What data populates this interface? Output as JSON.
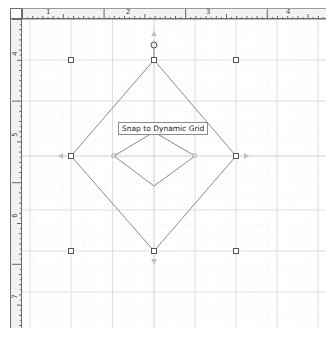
{
  "rulers": {
    "horizontal_labels": [
      "1",
      "2",
      "3",
      "4"
    ],
    "vertical_labels": [
      "4",
      "5",
      "6",
      "7"
    ]
  },
  "canvas": {
    "tooltip": "Snap to Dynamic Grid",
    "shape": {
      "type": "diamond",
      "outer": {
        "top": [
          154,
          60
        ],
        "left": [
          71,
          156
        ],
        "right": [
          236,
          156
        ],
        "bottom": [
          154,
          251
        ]
      },
      "inner": {
        "top": [
          154,
          132
        ],
        "left": [
          114,
          156
        ],
        "right": [
          195,
          156
        ],
        "bottom": [
          154,
          186
        ]
      }
    },
    "colors": {
      "grid_major": "#dcdcdc",
      "grid_minor": "#eeeeee",
      "shape_stroke": "#8a8a8a",
      "handle_stroke": "#555555"
    }
  }
}
